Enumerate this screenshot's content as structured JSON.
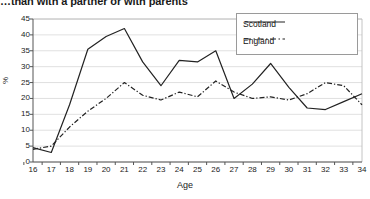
{
  "chart_data": {
    "type": "line",
    "title": "…than with a partner or with parents",
    "xlabel": "Age",
    "ylabel": "%",
    "xlim": [
      16,
      34
    ],
    "ylim": [
      0,
      45
    ],
    "ytick_step": 5,
    "grid": true,
    "legend_position": "top-right",
    "x": [
      16,
      17,
      18,
      19,
      20,
      21,
      22,
      23,
      24,
      25,
      26,
      27,
      28,
      29,
      30,
      31,
      32,
      33,
      34
    ],
    "xticklabels": [
      "16",
      "17",
      "18",
      "19",
      "20",
      "21",
      "22",
      "23",
      "24",
      "25",
      "26",
      "27",
      "28",
      "29",
      "30",
      "31",
      "32",
      "33",
      "34"
    ],
    "yticklabels": [
      "0",
      "5",
      "10",
      "15",
      "20",
      "25",
      "30",
      "35",
      "40",
      "45"
    ],
    "series": [
      {
        "name": "Scotland",
        "style": "solid",
        "color": "#222222",
        "values": [
          4.5,
          3.0,
          18.0,
          35.5,
          39.5,
          42.0,
          31.5,
          24.0,
          32.0,
          31.5,
          35.0,
          20.0,
          24.5,
          31.0,
          23.5,
          17.0,
          16.5,
          19.0,
          21.5
        ]
      },
      {
        "name": "England",
        "style": "dash-dot",
        "color": "#222222",
        "values": [
          4.0,
          5.0,
          11.0,
          16.0,
          20.0,
          25.0,
          21.0,
          19.5,
          22.0,
          20.5,
          25.5,
          22.0,
          20.0,
          20.5,
          19.5,
          21.5,
          25.0,
          24.0,
          18.0
        ]
      }
    ]
  },
  "legend": {
    "items": [
      {
        "label": "Scotland"
      },
      {
        "label": "England"
      }
    ]
  }
}
